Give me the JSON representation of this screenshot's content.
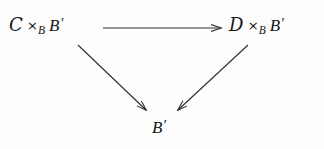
{
  "figure": {
    "kind": "commutative-diagram",
    "shape": "triangle",
    "background_color": "#fdfdfd",
    "ink_color": "#303030",
    "text_color": "#171717"
  },
  "nodes": {
    "top_left": {
      "id": "C-fiber-product",
      "script_letter": "C",
      "times": "×",
      "subscript": "B",
      "base": "B",
      "prime": "′",
      "plain_text": "𝒞 ×_B B′"
    },
    "top_right": {
      "id": "D-fiber-product",
      "script_letter": "D",
      "times": "×",
      "subscript": "B",
      "base": "B",
      "prime": "′",
      "plain_text": "𝒟 ×_B B′"
    },
    "bottom": {
      "id": "B-prime",
      "base": "B",
      "prime": "′",
      "plain_text": "B′"
    }
  },
  "arrows": [
    {
      "name": "arrow-top-horizontal",
      "from": "top_left",
      "to": "top_right",
      "direction": "right",
      "label": "",
      "x1": 103,
      "y1": 28,
      "x2": 221,
      "y2": 28
    },
    {
      "name": "arrow-left-diagonal",
      "from": "top_left",
      "to": "bottom",
      "direction": "down-right",
      "label": "",
      "x1": 78,
      "y1": 45,
      "x2": 147,
      "y2": 111
    },
    {
      "name": "arrow-right-diagonal",
      "from": "top_right",
      "to": "bottom",
      "direction": "down-left",
      "label": "",
      "x1": 248,
      "y1": 45,
      "x2": 177,
      "y2": 111
    }
  ]
}
